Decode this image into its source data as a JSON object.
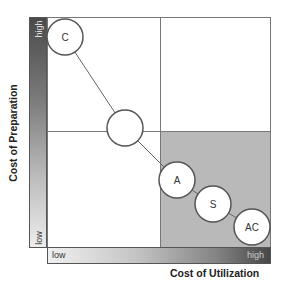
{
  "axes": {
    "y_label": "Cost of Preparation",
    "y_high": "high",
    "y_low": "low",
    "x_label": "Cost of Utilization",
    "x_low": "low",
    "x_high": "high"
  },
  "quadrants": {
    "shaded": "bottom-right",
    "shade_color": "#b9b9b9"
  },
  "nodes": [
    {
      "label": "C",
      "cx": 65,
      "cy": 37
    },
    {
      "label": "",
      "cx": 125,
      "cy": 128
    },
    {
      "label": "A",
      "cx": 177,
      "cy": 180
    },
    {
      "label": "S",
      "cx": 213,
      "cy": 204
    },
    {
      "label": "AC",
      "cx": 252,
      "cy": 227
    }
  ],
  "node_radius": 18,
  "colors": {
    "line": "#666666",
    "node_fill": "#ffffff",
    "node_stroke": "#555555"
  }
}
